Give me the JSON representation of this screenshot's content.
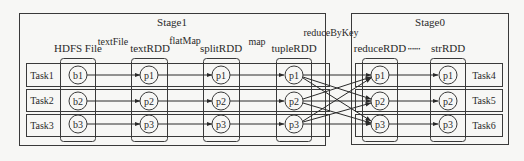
{
  "stages": [
    {
      "label": "Stage1"
    },
    {
      "label": "Stage0"
    }
  ],
  "columns": [
    {
      "label": "HDFS File",
      "nodes": [
        "b1",
        "b2",
        "b3"
      ]
    },
    {
      "label": "textRDD",
      "nodes": [
        "p1",
        "p2",
        "p3"
      ]
    },
    {
      "label": "splitRDD",
      "nodes": [
        "p1",
        "p2",
        "p3"
      ]
    },
    {
      "label": "tupleRDD",
      "nodes": [
        "p1",
        "p2",
        "p3"
      ]
    },
    {
      "label": "reduceRDD",
      "nodes": [
        "p1",
        "p2",
        "p3"
      ]
    },
    {
      "label": "strRDD",
      "nodes": [
        "p1",
        "p2",
        "p3"
      ]
    }
  ],
  "transforms": {
    "t0": "textFile",
    "t1": "flatMap",
    "t2": "map",
    "t3": "reduceByKey",
    "ellipsis": "••••••"
  },
  "tasks_left": [
    "Task1",
    "Task2",
    "Task3"
  ],
  "tasks_right": [
    "Task4",
    "Task5",
    "Task6"
  ],
  "colors": {
    "line": "#3a3a3a",
    "background": "#f7f7f5"
  }
}
